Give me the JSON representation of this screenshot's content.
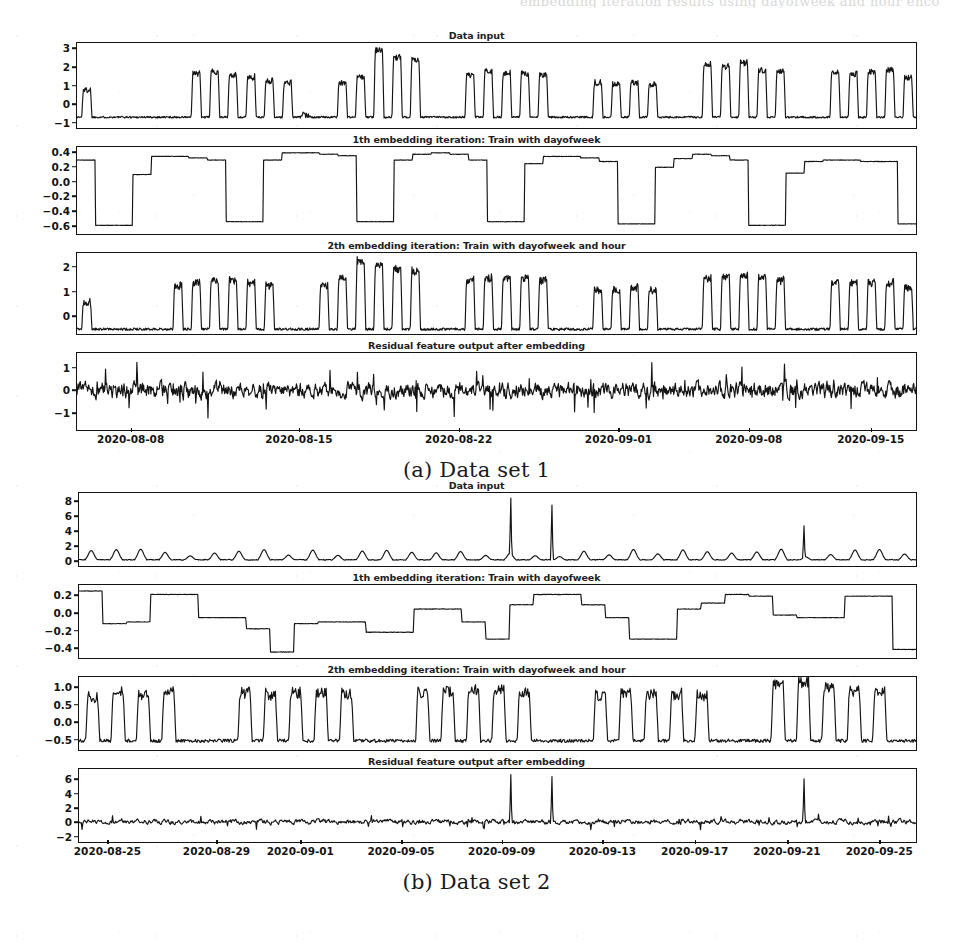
{
  "page": {
    "cut_header_text": "embedding iteration results using dayofweek and hour encoding"
  },
  "figures": [
    {
      "id": "figure-a",
      "caption": "(a) Data set 1",
      "xticks": [
        "2020-08-08",
        "2020-08-15",
        "2020-08-22",
        "2020-09-01",
        "2020-09-08",
        "2020-09-15"
      ],
      "xtick_positions": [
        0.065,
        0.265,
        0.455,
        0.645,
        0.8,
        0.945
      ],
      "panels": [
        {
          "title": "Data input",
          "yticks": [
            "3",
            "2",
            "1",
            "0",
            "-1"
          ],
          "ylim": [
            -1.35,
            3.35
          ],
          "ytick_values": [
            3,
            2,
            1,
            0,
            -1
          ]
        },
        {
          "title": "1th embedding iteration: Train with dayofweek",
          "yticks": [
            "0.4",
            "0.2",
            "0.0",
            "-0.2",
            "-0.4",
            "-0.6"
          ],
          "ylim": [
            -0.72,
            0.48
          ],
          "ytick_values": [
            0.4,
            0.2,
            0.0,
            -0.2,
            -0.4,
            -0.6
          ]
        },
        {
          "title": "2th embedding iteration: Train with dayofweek and hour",
          "yticks": [
            "2",
            "1",
            "0"
          ],
          "ylim": [
            -0.75,
            2.6
          ],
          "ytick_values": [
            2,
            1,
            0
          ]
        },
        {
          "title": "Residual feature output after embedding",
          "yticks": [
            "1",
            "0",
            "-1"
          ],
          "ylim": [
            -1.8,
            1.7
          ],
          "ytick_values": [
            1,
            0,
            -1
          ]
        }
      ]
    },
    {
      "id": "figure-b",
      "caption": "(b) Data set 2",
      "xticks": [
        "2020-08-25",
        "2020-08-29",
        "2020-09-01",
        "2020-09-05",
        "2020-09-09",
        "2020-09-13",
        "2020-09-17",
        "2020-09-21",
        "2020-09-25"
      ],
      "xtick_positions": [
        0.035,
        0.165,
        0.265,
        0.385,
        0.505,
        0.625,
        0.735,
        0.845,
        0.955
      ],
      "panels": [
        {
          "title": "Data input",
          "yticks": [
            "8",
            "6",
            "4",
            "2",
            "0"
          ],
          "ylim": [
            -0.8,
            9.2
          ],
          "ytick_values": [
            8,
            6,
            4,
            2,
            0
          ]
        },
        {
          "title": "1th embedding iteration: Train with dayofweek",
          "yticks": [
            "0.2",
            "0.0",
            "-0.2",
            "-0.4"
          ],
          "ylim": [
            -0.52,
            0.33
          ],
          "ytick_values": [
            0.2,
            0.0,
            -0.2,
            -0.4
          ]
        },
        {
          "title": "2th embedding iteration: Train with dayofweek and hour",
          "yticks": [
            "1.0",
            "0.5",
            "0.0",
            "-0.5"
          ],
          "ylim": [
            -0.82,
            1.32
          ],
          "ytick_values": [
            1.0,
            0.5,
            0.0,
            -0.5
          ]
        },
        {
          "title": "Residual feature output after embedding",
          "yticks": [
            "6",
            "4",
            "2",
            "0",
            "-2"
          ],
          "ylim": [
            -2.9,
            7.6
          ],
          "ytick_values": [
            6,
            4,
            2,
            0,
            -2
          ]
        }
      ]
    }
  ],
  "chart_data": [
    {
      "type": "line",
      "figure": "(a) Data set 1",
      "panel": "Data input",
      "title": "Data input",
      "xlabel": "",
      "ylabel": "",
      "ylim": [
        -1.35,
        3.35
      ],
      "yticks": [
        3,
        2,
        1,
        0,
        -1
      ],
      "xticks": [
        "2020-08-08",
        "2020-08-15",
        "2020-08-22",
        "2020-09-01",
        "2020-09-08",
        "2020-09-15"
      ],
      "grid": false,
      "legend": "none",
      "description": "Daily periodic load signal; flat baseline near -0.75 with daily peaks reaching 1 to 3. Weekend gaps show flat low plateaus.",
      "series": [
        {
          "name": "data input",
          "daily_peaks": [
            0.8,
            -0.7,
            -0.7,
            -0.7,
            -0.7,
            -0.7,
            1.7,
            1.8,
            1.6,
            1.5,
            1.3,
            1.2,
            -0.6,
            -0.7,
            1.2,
            1.5,
            3.0,
            2.6,
            2.5,
            -0.7,
            -0.7,
            1.6,
            1.8,
            1.7,
            1.7,
            1.6,
            -0.7,
            -0.7,
            1.2,
            1.1,
            1.2,
            1.1,
            -0.7,
            -0.7,
            2.2,
            2.1,
            2.3,
            1.9,
            1.8,
            -0.7,
            -0.7,
            1.8,
            1.7,
            1.8,
            1.9,
            1.5
          ],
          "baseline": -0.75
        }
      ]
    },
    {
      "type": "line",
      "figure": "(a) Data set 1",
      "panel": "1th embedding iteration: Train with dayofweek",
      "title": "1th embedding iteration: Train with dayofweek",
      "ylim": [
        -0.72,
        0.48
      ],
      "yticks": [
        0.4,
        0.2,
        0.0,
        -0.2,
        -0.4,
        -0.6
      ],
      "grid": false,
      "legend": "none",
      "description": "Weekly step function learned from dayofweek: high plateaus near 0.3-0.4 on weekdays and deep drops to -0.6 on weekends.",
      "series": [
        {
          "name": "dayofweek embedding",
          "step_values": [
            0.3,
            -0.6,
            -0.6,
            0.1,
            0.35,
            0.35,
            0.33,
            0.3,
            -0.55,
            -0.55,
            0.3,
            0.4,
            0.4,
            0.38,
            0.36,
            -0.55,
            -0.55,
            0.3,
            0.38,
            0.4,
            0.38,
            0.3,
            -0.55,
            -0.55,
            0.25,
            0.35,
            0.35,
            0.33,
            0.28,
            -0.58,
            -0.58,
            0.2,
            0.32,
            0.38,
            0.36,
            0.3,
            -0.6,
            -0.6,
            0.12,
            0.28,
            0.3,
            0.3,
            0.28,
            0.28,
            -0.58
          ]
        }
      ]
    },
    {
      "type": "line",
      "figure": "(a) Data set 1",
      "panel": "2th embedding iteration: Train with dayofweek and hour",
      "title": "2th embedding iteration: Train with dayofweek and hour",
      "ylim": [
        -0.75,
        2.6
      ],
      "yticks": [
        2,
        1,
        0
      ],
      "grid": false,
      "legend": "none",
      "description": "Combined dayofweek+hour embedding reproduces the daily square-wave shape; peaks 1.0-2.3, troughs near -0.55.",
      "series": [
        {
          "name": "dayofweek+hour embedding",
          "daily_peaks": [
            0.6,
            -0.55,
            -0.55,
            -0.5,
            -0.5,
            1.3,
            1.4,
            1.5,
            1.5,
            1.4,
            1.3,
            -0.5,
            -0.5,
            1.3,
            1.6,
            2.3,
            2.1,
            2.0,
            1.9,
            -0.5,
            -0.5,
            1.5,
            1.6,
            1.6,
            1.6,
            1.5,
            -0.5,
            -0.5,
            1.1,
            1.1,
            1.2,
            1.1,
            -0.5,
            -0.5,
            1.6,
            1.7,
            1.7,
            1.6,
            1.5,
            -0.5,
            -0.5,
            1.4,
            1.4,
            1.4,
            1.4,
            1.2
          ],
          "baseline": -0.55
        }
      ]
    },
    {
      "type": "line",
      "figure": "(a) Data set 1",
      "panel": "Residual feature output after embedding",
      "title": "Residual feature output after embedding",
      "ylim": [
        -1.8,
        1.7
      ],
      "yticks": [
        1,
        0,
        -1
      ],
      "grid": false,
      "legend": "none",
      "description": "Residual after removing embeddings: noisy signal centred near 0, ranging roughly -1.5 to 1.2 with occasional spikes.",
      "series": [
        {
          "name": "residual",
          "noise_range": [
            -1.5,
            1.2
          ],
          "mean": 0.0
        }
      ]
    },
    {
      "type": "line",
      "figure": "(b) Data set 2",
      "panel": "Data input",
      "title": "Data input",
      "ylim": [
        -0.8,
        9.2
      ],
      "yticks": [
        8,
        6,
        4,
        2,
        0
      ],
      "xticks": [
        "2020-08-25",
        "2020-08-29",
        "2020-09-01",
        "2020-09-05",
        "2020-09-09",
        "2020-09-13",
        "2020-09-17",
        "2020-09-21",
        "2020-09-25"
      ],
      "grid": false,
      "legend": "none",
      "description": "Mostly flat near 0 with small daily bumps of 0.5-1.5 and three very large isolated spikes of about 8.5, 7.5 and 4.7.",
      "series": [
        {
          "name": "data input",
          "spikes": [
            {
              "x": "2020-09-10",
              "y": 8.5
            },
            {
              "x": "2020-09-11",
              "y": 7.5
            },
            {
              "x": "2020-09-23",
              "y": 4.7
            }
          ],
          "baseline": 0.0
        }
      ]
    },
    {
      "type": "line",
      "figure": "(b) Data set 2",
      "panel": "1th embedding iteration: Train with dayofweek",
      "title": "1th embedding iteration: Train with dayofweek",
      "ylim": [
        -0.52,
        0.33
      ],
      "yticks": [
        0.2,
        0.0,
        -0.2,
        -0.4
      ],
      "grid": false,
      "legend": "none",
      "description": "Weekly step embedding oscillating between about +0.27 and -0.45.",
      "series": [
        {
          "name": "dayofweek embedding",
          "step_values": [
            0.26,
            -0.12,
            -0.1,
            0.22,
            0.22,
            -0.05,
            -0.05,
            -0.18,
            -0.45,
            -0.12,
            -0.1,
            -0.1,
            -0.22,
            -0.22,
            0.05,
            0.05,
            -0.1,
            -0.3,
            0.1,
            0.22,
            0.22,
            0.1,
            -0.05,
            -0.3,
            -0.3,
            0.05,
            0.12,
            0.22,
            0.2,
            -0.02,
            -0.05,
            -0.05,
            0.2,
            0.2,
            -0.42
          ]
        }
      ]
    },
    {
      "type": "line",
      "figure": "(b) Data set 2",
      "panel": "2th embedding iteration: Train with dayofweek and hour",
      "title": "2th embedding iteration: Train with dayofweek and hour",
      "ylim": [
        -0.82,
        1.32
      ],
      "yticks": [
        1.0,
        0.5,
        0.0,
        -0.5
      ],
      "grid": false,
      "legend": "none",
      "description": "Daily square waves rising from about -0.55 baseline to peaks of 0.7-1.2.",
      "series": [
        {
          "name": "dayofweek+hour embedding",
          "daily_peaks": [
            0.75,
            0.95,
            0.85,
            0.9,
            -0.5,
            -0.5,
            0.9,
            0.85,
            0.9,
            0.9,
            0.85,
            -0.5,
            -0.5,
            0.9,
            0.95,
            1.0,
            1.0,
            0.9,
            -0.5,
            -0.5,
            0.8,
            0.85,
            0.85,
            0.85,
            0.8,
            -0.5,
            -0.5,
            1.15,
            1.2,
            1.05,
            0.95,
            0.9,
            -0.5
          ],
          "baseline": -0.55
        }
      ]
    },
    {
      "type": "line",
      "figure": "(b) Data set 2",
      "panel": "Residual feature output after embedding",
      "title": "Residual feature output after embedding",
      "ylim": [
        -2.9,
        7.6
      ],
      "yticks": [
        6,
        4,
        2,
        0,
        -2
      ],
      "grid": false,
      "legend": "none",
      "description": "Residual near zero with small noise, plus the three large unexplained spikes reaching about 6.8, 6.5 and 6.2.",
      "series": [
        {
          "name": "residual",
          "spikes": [
            {
              "x": "2020-09-10",
              "y": 6.8
            },
            {
              "x": "2020-09-11",
              "y": 6.5
            },
            {
              "x": "2020-09-23",
              "y": 6.2
            }
          ],
          "noise_range": [
            -1.6,
            1.0
          ]
        }
      ]
    }
  ]
}
